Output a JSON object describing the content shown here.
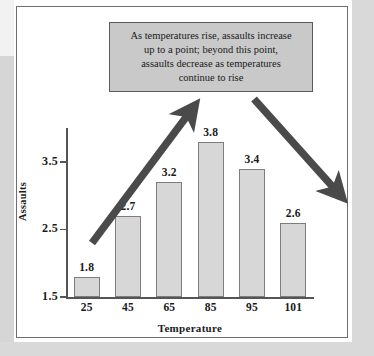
{
  "figure": {
    "frame_border_color": "#6e6e6e",
    "background_color": "#ffffff"
  },
  "callout": {
    "name": "annotation-callout",
    "fill_color": "#c9c9c9",
    "border_color": "#5a5a5a",
    "lines": [
      "As temperatures rise, assaults increase",
      "up to a point; beyond this point,",
      "assaults decrease as temperatures",
      "continue to rise"
    ],
    "full_text": "As temperatures rise, assaults increase up to a point; beyond this point, assaults decrease as temperatures continue to rise"
  },
  "arrows": [
    {
      "name": "rising-trend-arrow",
      "direction": "up-right",
      "color": "#4a4a4a",
      "from": [
        92,
        243
      ],
      "to": [
        196,
        104
      ]
    },
    {
      "name": "falling-trend-arrow",
      "direction": "down-right",
      "color": "#4a4a4a",
      "from": [
        254,
        99
      ],
      "to": [
        341,
        196
      ]
    }
  ],
  "chart_data": {
    "type": "bar",
    "title": "",
    "xlabel": "Temperature",
    "ylabel": "Assaults",
    "categories": [
      "25",
      "45",
      "65",
      "85",
      "95",
      "101"
    ],
    "values": [
      1.8,
      2.7,
      3.2,
      3.8,
      3.4,
      2.6
    ],
    "value_labels": [
      "1.8",
      "2.7",
      "3.2",
      "3.8",
      "3.4",
      "2.6"
    ],
    "ylim": [
      1.5,
      4.0
    ],
    "ytick_labels": [
      "1.5",
      "2.5",
      "3.5"
    ],
    "ytick_values": [
      1.5,
      2.5,
      3.5
    ],
    "grid": false,
    "legend": null,
    "bar_fill_color": "#d7d7d7",
    "bar_border_color": "#7d7d7d",
    "axis_color": "#555555"
  }
}
